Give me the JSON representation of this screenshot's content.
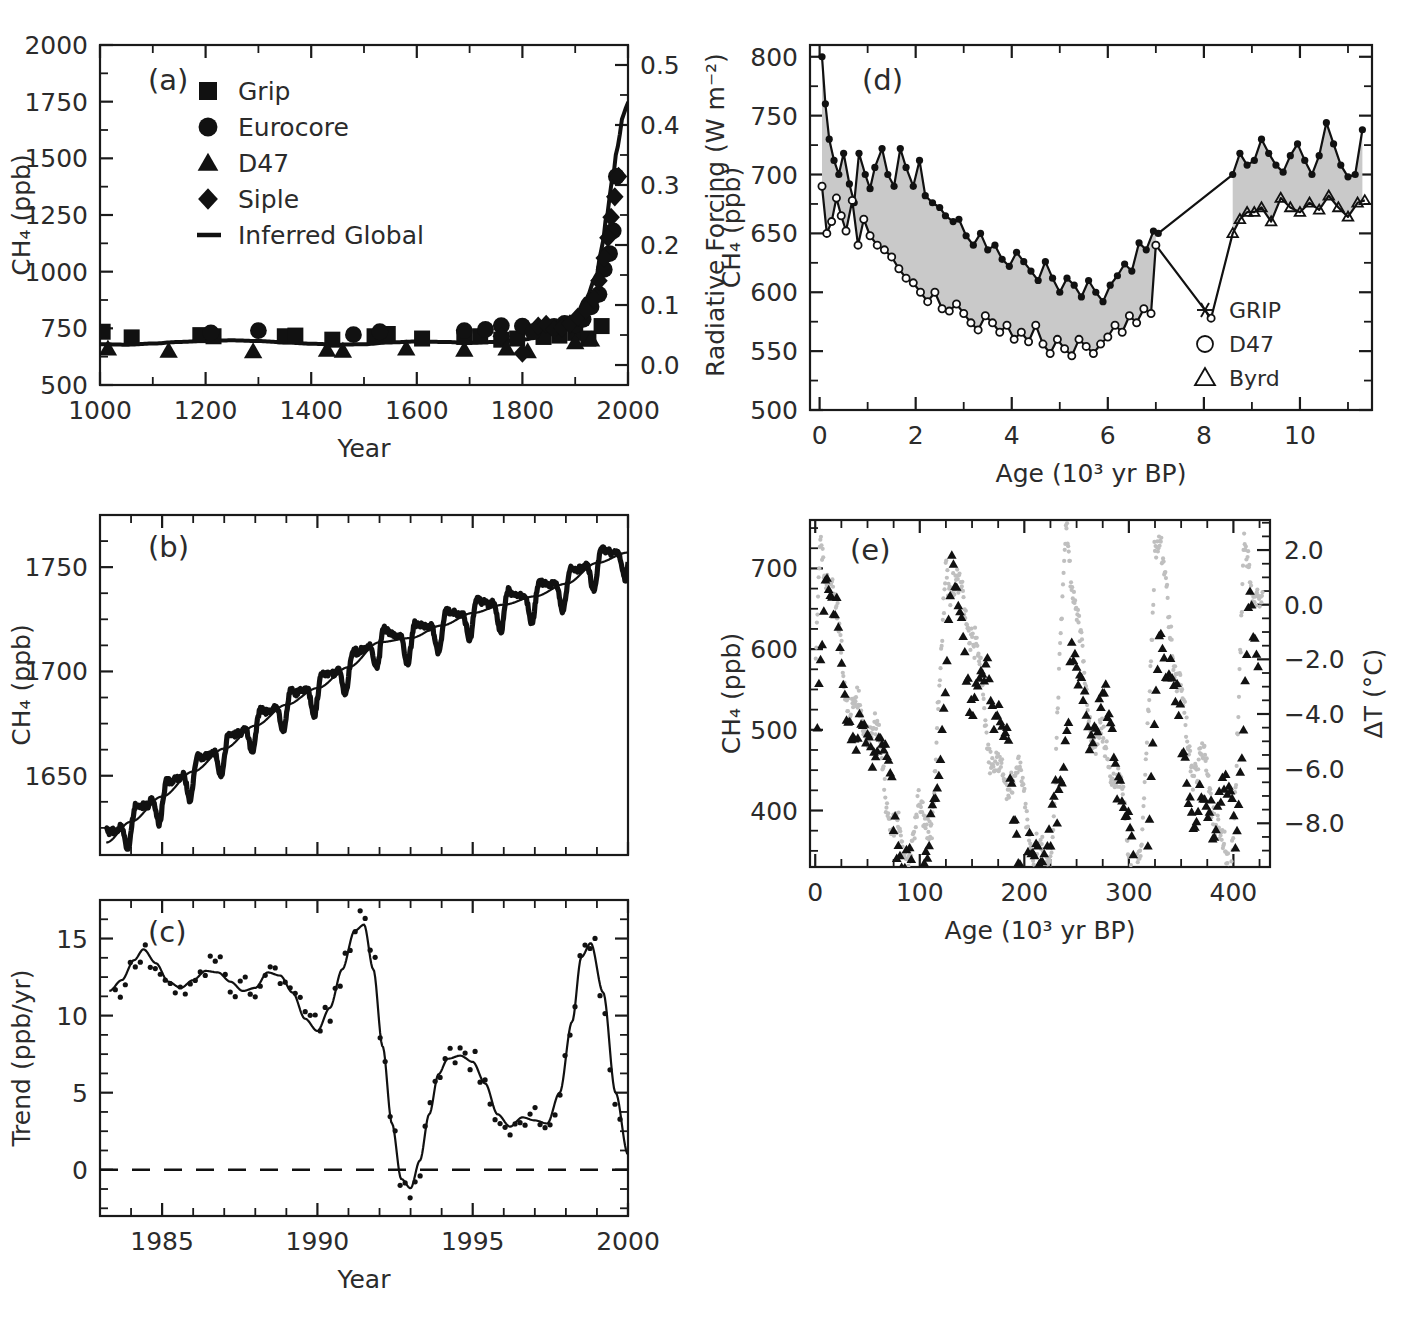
{
  "figure": {
    "panels": [
      "a",
      "b",
      "c",
      "d",
      "e"
    ]
  },
  "panel_a": {
    "id": "(a)",
    "legend": [
      {
        "marker": "square-marker",
        "label": "Grip"
      },
      {
        "marker": "circle-marker",
        "label": "Eurocore"
      },
      {
        "marker": "triangle-marker",
        "label": "D47"
      },
      {
        "marker": "diamond-marker",
        "label": "Siple"
      },
      {
        "marker": "line-marker",
        "label": "Inferred Global"
      }
    ],
    "chart_data": {
      "type": "scatter",
      "title": "",
      "xlabel": "Year",
      "ylabel": "CH₄ (ppb)",
      "y2label": "Radiative Forcing (W m⁻²)",
      "xlim": [
        1000,
        2000
      ],
      "ylim": [
        500,
        2000
      ],
      "y2lim": [
        -0.0333,
        0.5333
      ],
      "xticks": [
        1000,
        1200,
        1400,
        1600,
        1800,
        2000
      ],
      "xticklabels": [
        "1000",
        "1200",
        "1400",
        "1600",
        "1800",
        "2000"
      ],
      "yticks": [
        500,
        750,
        1000,
        1250,
        1500,
        1750,
        2000
      ],
      "yticklabels": [
        "500",
        "750",
        "1000",
        "1250",
        "1500",
        "1750",
        "2000"
      ],
      "y2ticks": [
        0.0,
        0.1,
        0.2,
        0.3,
        0.4,
        0.5
      ],
      "y2ticklabels": [
        "0.0",
        "0.1",
        "0.2",
        "0.3",
        "0.4",
        "0.5"
      ],
      "grid": false,
      "series": [
        {
          "name": "Inferred Global",
          "type": "line",
          "x": [
            1000,
            1050,
            1100,
            1150,
            1200,
            1250,
            1300,
            1350,
            1400,
            1450,
            1500,
            1550,
            1600,
            1650,
            1700,
            1750,
            1800,
            1830,
            1860,
            1880,
            1900,
            1920,
            1940,
            1950,
            1960,
            1970,
            1980,
            1990,
            1995,
            2000
          ],
          "y": [
            680,
            678,
            683,
            690,
            695,
            697,
            694,
            688,
            682,
            678,
            680,
            688,
            692,
            690,
            686,
            690,
            700,
            710,
            730,
            760,
            800,
            880,
            980,
            1100,
            1250,
            1400,
            1550,
            1680,
            1720,
            1745
          ]
        },
        {
          "name": "Grip",
          "type": "scatter",
          "marker": "square",
          "x": [
            1005,
            1060,
            1190,
            1215,
            1350,
            1370,
            1440,
            1520,
            1545,
            1610,
            1690,
            1720,
            1760,
            1790,
            1840,
            1870,
            1900,
            1925,
            1950
          ],
          "y": [
            735,
            710,
            720,
            715,
            715,
            718,
            700,
            715,
            725,
            705,
            712,
            715,
            700,
            705,
            712,
            718,
            730,
            705,
            760
          ]
        },
        {
          "name": "Eurocore",
          "type": "scatter",
          "marker": "circle",
          "x": [
            1210,
            1300,
            1480,
            1530,
            1690,
            1730,
            1760,
            1800,
            1820,
            1860,
            1880,
            1900,
            1915,
            1930,
            1945,
            1955,
            1965,
            1972,
            1978
          ],
          "y": [
            730,
            740,
            722,
            735,
            740,
            745,
            762,
            760,
            735,
            758,
            772,
            765,
            790,
            845,
            900,
            1010,
            1080,
            1180,
            1420
          ]
        },
        {
          "name": "D47",
          "type": "scatter",
          "marker": "triangle",
          "x": [
            1015,
            1130,
            1290,
            1430,
            1460,
            1580,
            1690,
            1770,
            1810,
            1900,
            1930
          ],
          "y": [
            660,
            650,
            648,
            655,
            650,
            660,
            655,
            660,
            648,
            688,
            700
          ]
        },
        {
          "name": "Siple",
          "type": "scatter",
          "marker": "diamond",
          "x": [
            1760,
            1800,
            1830,
            1845,
            1860,
            1875,
            1890,
            1905,
            1920,
            1935,
            1945,
            1955,
            1962,
            1968,
            1975,
            1982
          ],
          "y": [
            715,
            640,
            760,
            768,
            745,
            752,
            770,
            800,
            830,
            880,
            960,
            1060,
            1150,
            1240,
            1330,
            1420
          ]
        }
      ]
    }
  },
  "panel_b": {
    "id": "(b)",
    "chart_data": {
      "type": "line",
      "title": "",
      "xlabel": "Year",
      "ylabel": "CH₄ (ppb)",
      "xlim": [
        1983.0,
        2000.0
      ],
      "ylim": [
        1612,
        1775
      ],
      "xticks": [
        1985,
        1990,
        1995,
        2000
      ],
      "xticklabels": [
        "1985",
        "1990",
        "1995",
        "2000"
      ],
      "yticks": [
        1650,
        1700,
        1750
      ],
      "yticklabels": [
        "1650",
        "1700",
        "1750"
      ],
      "grid": false,
      "description": "Globally averaged monthly CH4 with seasonal cycle (thick noisy band) overlaid by a smooth deseasonalised trend line.",
      "series": [
        {
          "name": "trend",
          "type": "line",
          "x": [
            1983.2,
            1984,
            1985,
            1986,
            1987,
            1988,
            1989,
            1990,
            1991,
            1992,
            1993,
            1994,
            1995,
            1996,
            1997,
            1998,
            1999,
            2000
          ],
          "y": [
            1618,
            1628,
            1640,
            1652,
            1663,
            1674,
            1684,
            1692,
            1702,
            1714,
            1716,
            1722,
            1728,
            1732,
            1736,
            1742,
            1752,
            1757
          ]
        },
        {
          "name": "monthly_with_seasonal_cycle",
          "type": "line",
          "seasonal_amplitude_ppb": 11,
          "note": "annual oscillation superimposed on trend"
        }
      ]
    }
  },
  "panel_c": {
    "id": "(c)",
    "chart_data": {
      "type": "line",
      "title": "",
      "xlabel": "Year",
      "ylabel": "Trend (ppb/yr)",
      "xlim": [
        1983.0,
        2000.0
      ],
      "ylim": [
        -3.0,
        17.5
      ],
      "xticks": [
        1985,
        1990,
        1995,
        2000
      ],
      "xticklabels": [
        "1985",
        "1990",
        "1995",
        "2000"
      ],
      "yticks": [
        0,
        5,
        10,
        15
      ],
      "yticklabels": [
        "0",
        "5",
        "10",
        "15"
      ],
      "zero_line": 0,
      "zero_line_style": "dashed",
      "grid": false,
      "series": [
        {
          "name": "growth_rate",
          "type": "line",
          "x": [
            1983.3,
            1983.7,
            1984.1,
            1984.4,
            1984.8,
            1985.2,
            1985.6,
            1986.0,
            1986.4,
            1986.8,
            1987.2,
            1987.6,
            1988.0,
            1988.4,
            1988.8,
            1989.2,
            1989.6,
            1990.0,
            1990.4,
            1990.8,
            1991.2,
            1991.5,
            1991.8,
            1992.1,
            1992.4,
            1992.7,
            1993.0,
            1993.3,
            1993.6,
            1993.9,
            1994.2,
            1994.6,
            1995.0,
            1995.4,
            1995.8,
            1996.2,
            1996.6,
            1997.0,
            1997.4,
            1997.8,
            1998.2,
            1998.5,
            1998.8,
            1999.2,
            1999.6,
            2000.0
          ],
          "y": [
            11.6,
            12.3,
            13.6,
            14.3,
            13.4,
            12.2,
            11.8,
            12.3,
            12.9,
            12.8,
            12.2,
            11.6,
            11.8,
            12.8,
            12.6,
            11.5,
            9.8,
            9.0,
            10.5,
            13.0,
            15.5,
            15.9,
            13.0,
            8.0,
            3.0,
            -0.6,
            -1.2,
            0.6,
            3.6,
            6.2,
            7.2,
            7.4,
            7.0,
            5.6,
            3.6,
            2.8,
            3.4,
            3.2,
            3.0,
            5.0,
            9.6,
            13.8,
            14.7,
            11.5,
            5.0,
            1.0
          ]
        },
        {
          "name": "monthly_points",
          "type": "scatter",
          "marker": "small-dot",
          "description": "dense small dots scattered about the smooth growth-rate curve, spread roughly ±1.5 ppb/yr"
        }
      ]
    }
  },
  "panel_d": {
    "id": "(d)",
    "legend": [
      {
        "marker": "asterisk-marker",
        "label": "GRIP"
      },
      {
        "marker": "open-circle-marker",
        "label": "D47"
      },
      {
        "marker": "open-triangle-marker",
        "label": "Byrd"
      }
    ],
    "chart_data": {
      "type": "line",
      "title": "",
      "xlabel": "Age (10³ yr BP)",
      "ylabel": "CH₄ (ppb)",
      "xlim": [
        -0.2,
        11.5
      ],
      "ylim": [
        500,
        810
      ],
      "xticks": [
        0,
        2,
        4,
        6,
        8,
        10
      ],
      "xticklabels": [
        "0",
        "2",
        "4",
        "6",
        "8",
        "10"
      ],
      "yticks": [
        500,
        550,
        600,
        650,
        700,
        750,
        800
      ],
      "yticklabels": [
        "500",
        "550",
        "600",
        "650",
        "700",
        "750",
        "800"
      ],
      "grid": false,
      "shaded_band": true,
      "shaded_band_color": "#c9c9c9",
      "description": "Greenland (upper, GRIP) and Antarctic (lower, D47/Byrd) Holocene CH4; grey shading is the interpolar difference.",
      "series": [
        {
          "name": "Greenland (GRIP)",
          "type": "line",
          "marker": "asterisk",
          "x": [
            0.05,
            0.12,
            0.2,
            0.3,
            0.4,
            0.5,
            0.62,
            0.72,
            0.82,
            0.95,
            1.05,
            1.15,
            1.3,
            1.42,
            1.55,
            1.68,
            1.8,
            1.95,
            2.08,
            2.2,
            2.35,
            2.5,
            2.62,
            2.78,
            2.9,
            3.05,
            3.2,
            3.35,
            3.5,
            3.65,
            3.8,
            3.95,
            4.1,
            4.25,
            4.4,
            4.55,
            4.7,
            4.85,
            5.0,
            5.15,
            5.3,
            5.45,
            5.6,
            5.75,
            5.9,
            6.05,
            6.2,
            6.35,
            6.5,
            6.65,
            6.8,
            6.95,
            7.05,
            8.6,
            8.75,
            8.9,
            9.05,
            9.2,
            9.35,
            9.5,
            9.65,
            9.8,
            9.95,
            10.1,
            10.25,
            10.4,
            10.55,
            10.7,
            10.85,
            11.0,
            11.15,
            11.3
          ],
          "y": [
            800,
            760,
            730,
            712,
            700,
            718,
            692,
            676,
            718,
            700,
            688,
            706,
            722,
            700,
            690,
            722,
            706,
            690,
            712,
            682,
            676,
            672,
            665,
            660,
            662,
            648,
            640,
            650,
            636,
            640,
            628,
            622,
            634,
            626,
            618,
            610,
            626,
            612,
            600,
            612,
            606,
            596,
            610,
            600,
            592,
            606,
            614,
            624,
            618,
            642,
            636,
            652,
            650,
            700,
            718,
            708,
            712,
            730,
            718,
            708,
            702,
            716,
            726,
            712,
            700,
            716,
            744,
            726,
            708,
            698,
            700,
            738
          ]
        },
        {
          "name": "Antarctic (D47 / Byrd)",
          "type": "line",
          "marker": "open-circle-and-triangle",
          "x": [
            0.05,
            0.15,
            0.25,
            0.35,
            0.45,
            0.55,
            0.68,
            0.8,
            0.92,
            1.05,
            1.2,
            1.35,
            1.5,
            1.65,
            1.8,
            1.95,
            2.1,
            2.25,
            2.4,
            2.55,
            2.7,
            2.85,
            3.0,
            3.15,
            3.3,
            3.45,
            3.6,
            3.75,
            3.9,
            4.05,
            4.2,
            4.35,
            4.5,
            4.65,
            4.8,
            4.95,
            5.1,
            5.25,
            5.4,
            5.55,
            5.7,
            5.85,
            6.0,
            6.15,
            6.3,
            6.45,
            6.6,
            6.75,
            6.9,
            7.0,
            8.15,
            8.6,
            8.75,
            8.9,
            9.05,
            9.2,
            9.4,
            9.6,
            9.8,
            10.0,
            10.2,
            10.4,
            10.6,
            10.8,
            11.0,
            11.2,
            11.35
          ],
          "y": [
            690,
            650,
            660,
            680,
            665,
            652,
            678,
            640,
            662,
            648,
            640,
            636,
            630,
            620,
            612,
            608,
            600,
            592,
            600,
            586,
            584,
            590,
            582,
            574,
            568,
            580,
            574,
            566,
            572,
            560,
            566,
            558,
            572,
            556,
            548,
            560,
            552,
            546,
            560,
            554,
            548,
            556,
            562,
            572,
            566,
            580,
            574,
            586,
            582,
            640,
            578,
            650,
            662,
            668,
            668,
            672,
            660,
            680,
            672,
            668,
            676,
            670,
            682,
            672,
            664,
            676,
            678
          ]
        }
      ]
    }
  },
  "panel_e": {
    "id": "(e)",
    "chart_data": {
      "type": "scatter",
      "title": "",
      "xlabel": "Age (10³ yr BP)",
      "ylabel": "CH₄ (ppb)",
      "y2label": "ΔT (°C)",
      "xlim": [
        -5,
        435
      ],
      "ylim": [
        330,
        760
      ],
      "y2lim": [
        -9.6,
        3.1
      ],
      "xticks": [
        0,
        100,
        200,
        300,
        400
      ],
      "xticklabels": [
        "0",
        "100",
        "200",
        "300",
        "400"
      ],
      "yticks": [
        400,
        500,
        600,
        700
      ],
      "yticklabels": [
        "400",
        "500",
        "600",
        "700"
      ],
      "y2ticks": [
        2.0,
        0.0,
        -2.0,
        -4.0,
        -6.0,
        -8.0
      ],
      "y2ticklabels": [
        "2.0",
        "0.0",
        "−2.0",
        "−4.0",
        "−6.0",
        "−8.0"
      ],
      "grid": false,
      "description": "Vostok 420 kyr record: grey points are ΔT (right axis), black triangles are CH4 (left axis). Four glacial-interglacial cycles with terminations near 0, 130, 240 and 335 kyr BP.",
      "series": [
        {
          "name": "ΔT (Vostok)",
          "type": "scatter",
          "marker": "small-dot",
          "color": "#bfbfbf",
          "axis": "right",
          "interglacial_peaks_kyr": [
            5,
            125,
            240,
            325,
            410
          ],
          "peak_values_C": [
            1.5,
            2.8,
            2.0,
            2.2,
            2.5
          ],
          "glacial_min_values_C": [
            -8.5,
            -8.0,
            -8.8,
            -8.5
          ]
        },
        {
          "name": "CH₄ (Vostok)",
          "type": "scatter",
          "marker": "triangle",
          "color": "#111111",
          "axis": "left",
          "interglacial_peaks_kyr": [
            10,
            130,
            245,
            330,
            415
          ],
          "peak_values_ppb": [
            660,
            700,
            640,
            620,
            680
          ],
          "glacial_min_values_ppb": [
            350,
            370,
            380,
            360
          ]
        }
      ]
    }
  }
}
